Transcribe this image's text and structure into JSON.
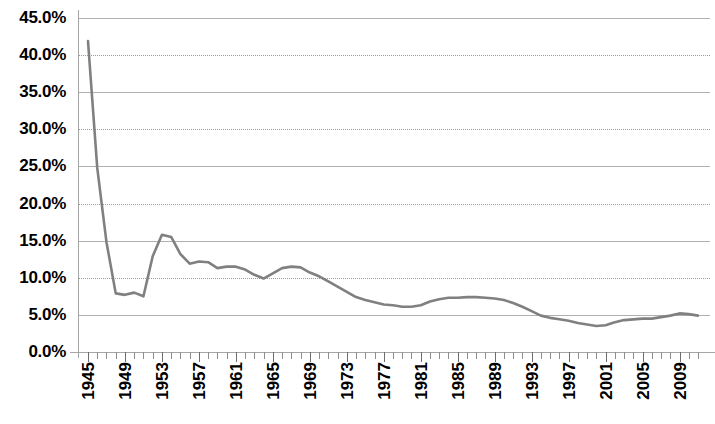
{
  "chart_data": {
    "type": "line",
    "title": "",
    "subtitle": "",
    "xlabel": "",
    "ylabel": "",
    "grid": true,
    "legend": null,
    "legend_position": "none",
    "xlim": [
      1945,
      2011
    ],
    "ylim": [
      0,
      45
    ],
    "y_tick_labels": [
      "45.0%",
      "40.0%",
      "35.0%",
      "30.0%",
      "25.0%",
      "20.0%",
      "15.0%",
      "10.0%",
      "5.0%",
      "0.0%"
    ],
    "y_tick_values": [
      45,
      40,
      35,
      30,
      25,
      20,
      15,
      10,
      5,
      0
    ],
    "x_tick_labels": [
      "1945",
      "1949",
      "1953",
      "1957",
      "1961",
      "1965",
      "1969",
      "1973",
      "1977",
      "1981",
      "1985",
      "1989",
      "1993",
      "1997",
      "2001",
      "2005",
      "2009"
    ],
    "x_tick_values": [
      1945,
      1949,
      1953,
      1957,
      1961,
      1965,
      1969,
      1973,
      1977,
      1981,
      1985,
      1989,
      1993,
      1997,
      2001,
      2005,
      2009
    ],
    "x_minor_tick_interval": 1,
    "series_color": "#808080",
    "series_line_width": 2.6,
    "x": [
      1945,
      1946,
      1947,
      1948,
      1949,
      1950,
      1951,
      1952,
      1953,
      1954,
      1955,
      1956,
      1957,
      1958,
      1959,
      1960,
      1961,
      1962,
      1963,
      1964,
      1965,
      1966,
      1967,
      1968,
      1969,
      1970,
      1971,
      1972,
      1973,
      1974,
      1975,
      1976,
      1977,
      1978,
      1979,
      1980,
      1981,
      1982,
      1983,
      1984,
      1985,
      1986,
      1987,
      1988,
      1989,
      1990,
      1991,
      1992,
      1993,
      1994,
      1995,
      1996,
      1997,
      1998,
      1999,
      2000,
      2001,
      2002,
      2003,
      2004,
      2005,
      2006,
      2007,
      2008,
      2009,
      2010,
      2011
    ],
    "values": [
      41.9,
      24.8,
      14.8,
      7.9,
      7.7,
      8.0,
      7.5,
      12.9,
      15.8,
      15.5,
      13.2,
      11.9,
      12.2,
      12.1,
      11.3,
      11.5,
      11.5,
      11.1,
      10.4,
      9.9,
      10.6,
      11.3,
      11.5,
      11.4,
      10.7,
      10.2,
      9.5,
      8.8,
      8.1,
      7.4,
      7.0,
      6.7,
      6.4,
      6.3,
      6.1,
      6.1,
      6.3,
      6.8,
      7.1,
      7.3,
      7.3,
      7.4,
      7.4,
      7.3,
      7.2,
      7.0,
      6.6,
      6.1,
      5.5,
      4.9,
      4.6,
      4.4,
      4.2,
      3.9,
      3.7,
      3.5,
      3.6,
      4.0,
      4.3,
      4.4,
      4.5,
      4.5,
      4.7,
      4.9,
      5.2,
      5.1,
      4.9
    ],
    "series_name": ""
  }
}
